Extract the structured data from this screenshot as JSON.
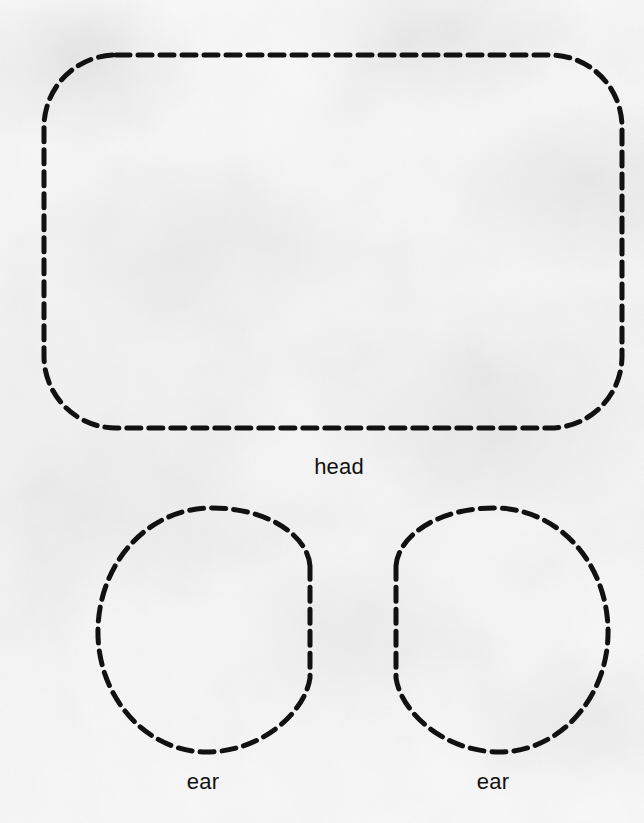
{
  "page": {
    "kind": "sewing-pattern-sheet",
    "background_color": "#f7f7f7",
    "stroke_color": "#111111",
    "width": 644,
    "height": 823
  },
  "stroke": {
    "width_px": 5,
    "dash_length_px": 14,
    "gap_length_px": 8,
    "linecap": "round"
  },
  "pieces": [
    {
      "id": "head",
      "label": "head",
      "shape": "rounded-rectangle",
      "x": 44,
      "y": 55,
      "width": 578,
      "height": 373,
      "corner_radius": 72
    },
    {
      "id": "ear-left",
      "label": "ear",
      "shape": "oval-flat-right",
      "x": 98,
      "y": 508,
      "width": 214,
      "height": 244
    },
    {
      "id": "ear-right",
      "label": "ear",
      "shape": "oval-flat-left",
      "x": 394,
      "y": 508,
      "width": 214,
      "height": 244
    }
  ],
  "labels": {
    "head": "head",
    "ear_left": "ear",
    "ear_right": "ear"
  }
}
